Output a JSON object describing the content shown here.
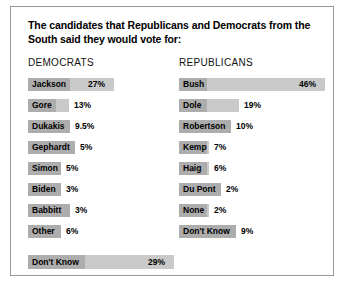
{
  "title": "The candidates that Republicans and Democrats from the South said they would vote for:",
  "columns": {
    "democrats_header": "DEMOCRATS",
    "republicans_header": "REPUBLICANS"
  },
  "chart_data": {
    "type": "bar",
    "title": "The candidates that Republicans and Democrats from the South said they would vote for:",
    "xlabel": "",
    "ylabel": "",
    "xlim": [
      0,
      46
    ],
    "grid": false,
    "legend": false,
    "orientation": "horizontal",
    "panels": [
      {
        "name": "DEMOCRATS",
        "categories": [
          "Jackson",
          "Gore",
          "Dukakis",
          "Gephardt",
          "Simon",
          "Biden",
          "Babbitt",
          "Other",
          "Don't Know"
        ],
        "values": [
          27,
          13,
          9.5,
          5,
          5,
          3,
          3,
          6,
          29
        ],
        "value_labels": [
          "27%",
          "13%",
          "9.5%",
          "5%",
          "5%",
          "3%",
          "3%",
          "6%",
          "29%"
        ]
      },
      {
        "name": "REPUBLICANS",
        "categories": [
          "Bush",
          "Dole",
          "Robertson",
          "Kemp",
          "Haig",
          "Du Pont",
          "None",
          "Don't Know"
        ],
        "values": [
          46,
          19,
          10,
          7,
          6,
          2,
          2,
          9
        ],
        "value_labels": [
          "46%",
          "19%",
          "10%",
          "7%",
          "6%",
          "2%",
          "2%",
          "9%"
        ]
      }
    ]
  }
}
